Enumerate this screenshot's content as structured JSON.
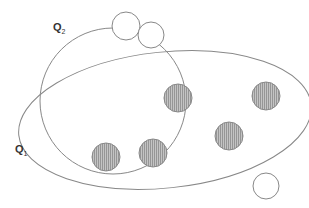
{
  "diagram": {
    "type": "set-diagram",
    "regions": [
      {
        "id": "Q1",
        "label": "Q",
        "subscript": "1",
        "shape": "ellipse",
        "cx": 165,
        "cy": 120,
        "rx": 147,
        "ry": 68
      },
      {
        "id": "Q2",
        "label": "Q",
        "subscript": "2",
        "shape": "circle",
        "cx": 113,
        "cy": 101,
        "r": 73
      }
    ],
    "points": [
      {
        "type": "filled",
        "cx": 178,
        "cy": 98,
        "r": 14
      },
      {
        "type": "filled",
        "cx": 266,
        "cy": 96,
        "r": 14
      },
      {
        "type": "filled",
        "cx": 229,
        "cy": 136,
        "r": 14
      },
      {
        "type": "filled",
        "cx": 153,
        "cy": 153,
        "r": 14
      },
      {
        "type": "filled",
        "cx": 106,
        "cy": 157,
        "r": 14
      },
      {
        "type": "open",
        "cx": 126,
        "cy": 26,
        "r": 14
      },
      {
        "type": "open",
        "cx": 151,
        "cy": 35,
        "r": 13
      },
      {
        "type": "open",
        "cx": 266,
        "cy": 186,
        "r": 13
      }
    ],
    "colors": {
      "stroke": "#888888",
      "fill": "#b8b8b8",
      "hatch": "#8a8a8a",
      "text": "#333333"
    }
  }
}
